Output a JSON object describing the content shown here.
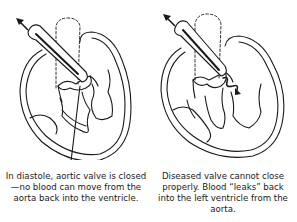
{
  "figure": {
    "panels": [
      {
        "id": "normal",
        "caption": "In diastole, aortic valve is closed—no blood can move from the aorta back into the ventricle.",
        "state": "valve-closed"
      },
      {
        "id": "diseased",
        "caption": "Diseased valve cannot close properly. Blood “leaks” back into the left ventricle from the aorta.",
        "state": "valve-leaking"
      }
    ],
    "colors": {
      "line": "#1a1a1a",
      "background": "#ffffff"
    }
  }
}
